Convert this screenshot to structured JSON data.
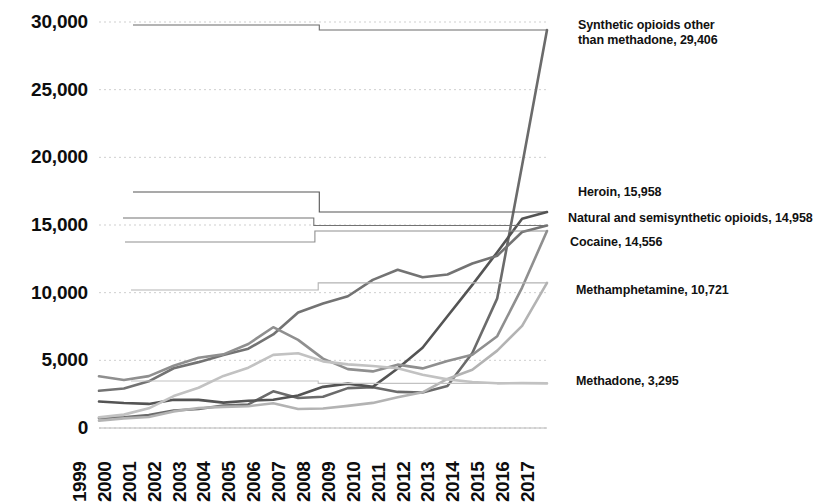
{
  "chart_data": {
    "type": "line",
    "title": "",
    "xlabel": "",
    "ylabel": "",
    "x": [
      1999,
      2000,
      2001,
      2002,
      2003,
      2004,
      2005,
      2006,
      2007,
      2008,
      2009,
      2010,
      2011,
      2012,
      2013,
      2014,
      2015,
      2016,
      2017
    ],
    "categories": [
      "1999",
      "2000",
      "2001",
      "2002",
      "2003",
      "2004",
      "2005",
      "2006",
      "2007",
      "2008",
      "2009",
      "2010",
      "2011",
      "2012",
      "2013",
      "2014",
      "2015",
      "2016",
      "2017"
    ],
    "ylim": [
      0,
      30000
    ],
    "yticks": [
      0,
      5000,
      10000,
      15000,
      20000,
      25000,
      30000
    ],
    "ytick_labels": [
      "0",
      "5,000",
      "10,000",
      "15,000",
      "20,000",
      "25,000",
      "30,000"
    ],
    "grid": "horizontal-dotted",
    "legend": "direct-labels-right",
    "series": [
      {
        "name": "Synthetic opioids other than methadone",
        "label": "Synthetic opioids other\nthan methadone, 29,406",
        "final_value": 29406,
        "color": "#6b6b6b",
        "values": [
          730,
          782,
          957,
          1295,
          1400,
          1664,
          1742,
          2707,
          2213,
          2306,
          2946,
          3007,
          2666,
          2628,
          3105,
          5544,
          9580,
          19413,
          29406
        ]
      },
      {
        "name": "Heroin",
        "label": "Heroin, 15,958",
        "final_value": 15958,
        "color": "#545454",
        "values": [
          1960,
          1842,
          1779,
          2089,
          2080,
          1878,
          2009,
          2088,
          2399,
          3041,
          3278,
          3036,
          4397,
          5925,
          8257,
          10574,
          12989,
          15469,
          15958
        ]
      },
      {
        "name": "Natural and semisynthetic opioids",
        "label": "Natural and semisynthetic opioids, 14,958",
        "final_value": 14958,
        "color": "#737373",
        "values": [
          2749,
          2917,
          3449,
          4416,
          4867,
          5401,
          5858,
          6913,
          8541,
          9206,
          9738,
          10943,
          11693,
          11140,
          11341,
          12159,
          12727,
          14487,
          14958
        ]
      },
      {
        "name": "Cocaine",
        "label": "Cocaine, 14,556",
        "final_value": 14556,
        "color": "#8f8f8f",
        "values": [
          3822,
          3544,
          3833,
          4599,
          5196,
          5443,
          6208,
          7448,
          6512,
          5129,
          4350,
          4183,
          4681,
          4404,
          4944,
          5415,
          6784,
          10375,
          14556
        ]
      },
      {
        "name": "Methamphetamine",
        "label": "Methamphetamine, 10,721",
        "final_value": 10721,
        "color": "#b3b3b3",
        "values": [
          547,
          708,
          817,
          1226,
          1480,
          1562,
          1608,
          1834,
          1405,
          1441,
          1632,
          1854,
          2266,
          2635,
          3627,
          4298,
          5716,
          7542,
          10721
        ]
      },
      {
        "name": "Methadone",
        "label": "Methadone, 3,295",
        "final_value": 3295,
        "color": "#c2c2c2",
        "values": [
          784,
          988,
          1456,
          2360,
          2974,
          3849,
          4460,
          5406,
          5518,
          4924,
          4700,
          4577,
          4418,
          3932,
          3591,
          3400,
          3301,
          3314,
          3295
        ]
      }
    ]
  },
  "labels": {
    "synthetic": "Synthetic opioids other\nthan methadone, 29,406",
    "heroin": "Heroin, 15,958",
    "natural": "Natural and semisynthetic opioids, 14,958",
    "cocaine": "Cocaine, 14,556",
    "meth": "Methamphetamine, 10,721",
    "methadone": "Methadone, 3,295"
  }
}
